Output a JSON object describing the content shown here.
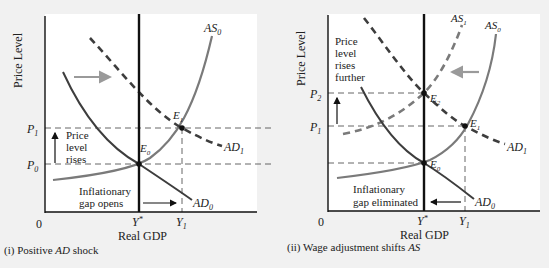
{
  "colors": {
    "background": "#f1f1f1",
    "plot_bg": "#ffffff",
    "axis": "#111111",
    "ad_curve": "#3d3d3d",
    "as_curve": "#7a7a7a",
    "shift_arrow": "#9a9a9a",
    "guide_dash": "#555555"
  },
  "panels": [
    {
      "id": "left",
      "caption_prefix": "(i) Positive ",
      "caption_italic": "AD",
      "caption_suffix": " shock",
      "y_axis_label": "Price Level",
      "x_axis_label": "Real GDP",
      "origin": "0",
      "x_ticks": [
        {
          "base": "Y",
          "sup": "*"
        },
        {
          "base": "Y",
          "sub": "1"
        }
      ],
      "y_ticks": [
        {
          "base": "P",
          "sub": "1"
        },
        {
          "base": "P",
          "sub": "0"
        }
      ],
      "curves": [
        {
          "name": "AS",
          "sub": "0",
          "style": "solid-gray"
        },
        {
          "name": "AD",
          "sub": "0",
          "style": "solid-dark"
        },
        {
          "name": "AD",
          "sub": "1",
          "style": "dashed-dark"
        }
      ],
      "points": [
        {
          "base": "E",
          "sub": "0"
        },
        {
          "base": "E",
          "sub": "1"
        }
      ],
      "annotations": {
        "price_note": [
          "Price",
          "level",
          "rises"
        ],
        "gap_note": [
          "Inflationary",
          "gap opens"
        ]
      }
    },
    {
      "id": "right",
      "caption_prefix": "(ii) Wage adjustment shifts ",
      "caption_italic": "AS",
      "caption_suffix": "",
      "y_axis_label": "Price Level",
      "x_axis_label": "Real GDP",
      "origin": "0",
      "x_ticks": [
        {
          "base": "Y",
          "sup": "*"
        },
        {
          "base": "Y",
          "sub": "1"
        }
      ],
      "y_ticks": [
        {
          "base": "P",
          "sub": "2"
        },
        {
          "base": "P",
          "sub": "1"
        }
      ],
      "curves": [
        {
          "name": "AS",
          "sub": "1",
          "style": "dashed-gray"
        },
        {
          "name": "AS",
          "sub": "0",
          "style": "solid-gray"
        },
        {
          "name": "AD",
          "sub": "1",
          "style": "dashed-dark"
        },
        {
          "name": "AD",
          "sub": "0",
          "style": "solid-dark"
        }
      ],
      "points": [
        {
          "base": "E",
          "sub": "2"
        },
        {
          "base": "E",
          "sub": "1"
        },
        {
          "base": "E",
          "sub": "0"
        }
      ],
      "annotations": {
        "price_note": [
          "Price",
          "level",
          "rises",
          "further"
        ],
        "gap_note": [
          "Inflationary",
          "gap eliminated"
        ]
      }
    }
  ]
}
